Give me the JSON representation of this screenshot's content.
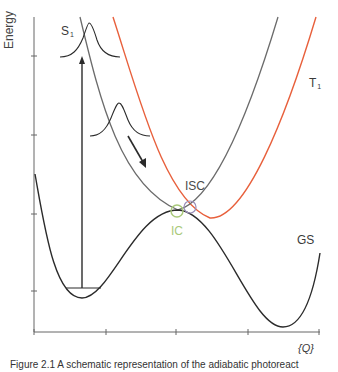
{
  "figure": {
    "y_axis_label": "Energy",
    "x_axis_label": "{Q}",
    "caption": "Figure 2.1  A schematic representation of the adiabatic photoreact",
    "colors": {
      "ground_state": "#2b2b2b",
      "singlet": "#6b6b6b",
      "triplet": "#e8603c",
      "ic_marker": "#a9c97a",
      "isc_marker": "#9a8fb8",
      "axis": "#666666"
    },
    "curves": [
      {
        "name": "GS",
        "label": "GS",
        "description": "ground state double-well surface"
      },
      {
        "name": "S1",
        "label": "S",
        "subscript": "1",
        "description": "first excited singlet surface"
      },
      {
        "name": "T1",
        "label": "T",
        "subscript": "1",
        "description": "first triplet surface"
      }
    ],
    "markers": [
      {
        "name": "IC",
        "label": "IC",
        "description": "internal conversion crossing"
      },
      {
        "name": "ISC",
        "label": "ISC",
        "description": "intersystem crossing"
      }
    ],
    "arrows": [
      {
        "name": "excitation",
        "description": "vertical excitation from GS minimum to S1"
      },
      {
        "name": "relaxation",
        "description": "wavepacket sliding down S1"
      }
    ],
    "axes": {
      "y_ticks": 4,
      "x_ticks": 5
    }
  }
}
